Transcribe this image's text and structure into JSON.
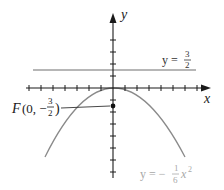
{
  "diagram": {
    "type": "parabola-focus-directrix",
    "axes": {
      "x_label": "x",
      "y_label": "y",
      "x_ticks_each_side": 7,
      "y_ticks_above": 4,
      "y_ticks_below": 7
    },
    "directrix": {
      "label_prefix": "y = ",
      "numerator": "3",
      "denominator": "2",
      "value": 1.5
    },
    "focus": {
      "label_name": "F",
      "label_open": "(0, −",
      "numerator": "3",
      "denominator": "2",
      "label_close": ")",
      "x": 0,
      "y": -1.5
    },
    "curve": {
      "label_prefix": "y = −",
      "numerator": "1",
      "denominator": "6",
      "variable": "x",
      "exponent": "2",
      "equation": "y = -1/6 x^2"
    },
    "colors": {
      "axis": "#1a1a1a",
      "curve": "#8a8a8a",
      "directrix": "#6e6e6e",
      "focus_point": "#111111",
      "curve_label": "#a8a8a8"
    }
  }
}
